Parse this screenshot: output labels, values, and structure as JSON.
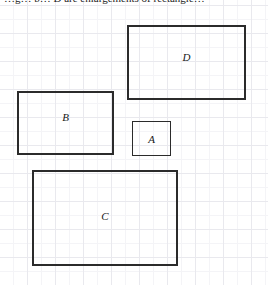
{
  "figure": {
    "caption": "…g… b… D are enlargements of rectangle…",
    "width": 268,
    "height": 285,
    "background_color": "#ffffff",
    "grid": {
      "visible": true,
      "major_cell_px": 28,
      "minor_cell_px": 14,
      "major_line_color": "#e9e9ee",
      "minor_line_color": "#f4f4f7"
    },
    "stroke_color": "#2b2b2b",
    "label_color": "#181818"
  },
  "rectangles": [
    {
      "label": "D",
      "x": 127,
      "y": 25,
      "width": 119,
      "height": 75,
      "label_offset_y": -6
    },
    {
      "label": "B",
      "x": 17,
      "y": 91,
      "width": 97,
      "height": 64,
      "label_offset_y": -6
    },
    {
      "label": "A",
      "x": 132,
      "y": 121,
      "width": 39,
      "height": 35,
      "label_offset_y": 0
    },
    {
      "label": "C",
      "x": 32,
      "y": 170,
      "width": 146,
      "height": 96,
      "label_offset_y": -2
    }
  ]
}
